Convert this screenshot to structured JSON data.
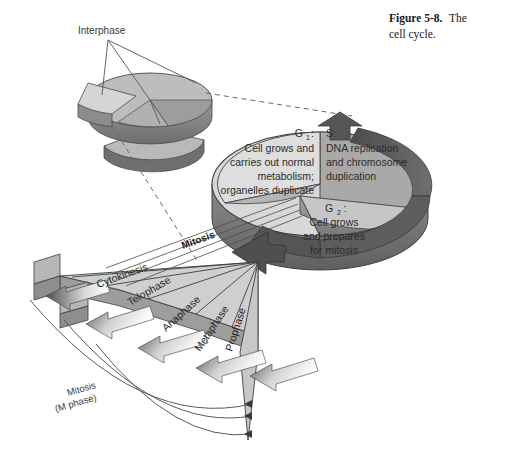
{
  "figure": {
    "caption_bold": "Figure 5-8.",
    "caption_rest": "The",
    "caption_line2": "cell cycle."
  },
  "inset": {
    "label": "Interphase"
  },
  "cycle": {
    "g1": {
      "name": "G",
      "sub": "1",
      "colon": ":",
      "line1": "Cell grows and",
      "line2": "carries out normal",
      "line3": "metabolism;",
      "line4": "organelles duplicate"
    },
    "s": {
      "name": "S:",
      "line1": "DNA replication",
      "line2": "and chromosome",
      "line3": "duplication"
    },
    "g2": {
      "name": "G",
      "sub": "2",
      "colon": ":",
      "line1": "Cell grows",
      "line2": "and prepares",
      "line3": "for mitosis"
    },
    "mitosis_wedge_label": "Mitosis"
  },
  "phases": [
    {
      "label": "Cytokinesis"
    },
    {
      "label": "Telophase"
    },
    {
      "label": "Anaphase"
    },
    {
      "label": "Metaphase"
    },
    {
      "label": "Prophase"
    }
  ],
  "bracket": {
    "line1": "Mitosis",
    "line2": "(M phase)"
  },
  "colors": {
    "background": "#ffffff",
    "g1_face": "#d8d8d8",
    "s_face": "#a9a9a9",
    "g2_face": "#c2c2c2",
    "rim_dark": "#8a8a8a",
    "rim_darker": "#6e6e6e",
    "arrow_dark": "#5a5a5a",
    "fan_face": "#cfcfcf",
    "fan_side": "#9d9d9d",
    "outline": "#4a4a4a",
    "text": "#2b2b2b"
  }
}
